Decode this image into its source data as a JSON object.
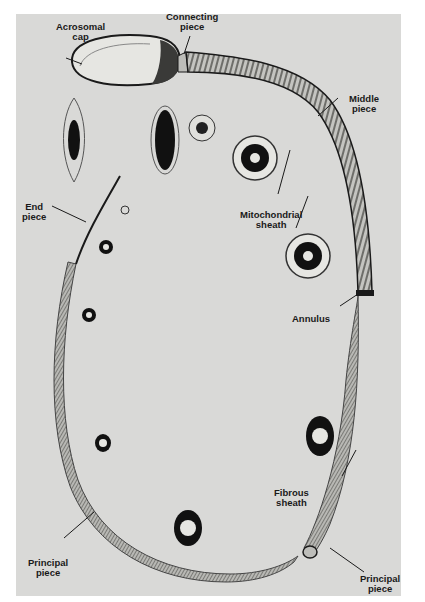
{
  "figure": {
    "background": "#d9d9d7",
    "ink": "#1a1a1a"
  },
  "labels": {
    "acrosomal_cap": "Acrosomal\ncap",
    "connecting_piece": "Connecting\npiece",
    "middle_piece": "Middle\npiece",
    "mitochondrial_sheath": "Mitochondrial\nsheath",
    "end_piece": "End\npiece",
    "annulus": "Annulus",
    "fibrous_sheath": "Fibrous\nsheath",
    "principal_piece_left": "Principal\npiece",
    "principal_piece_right": "Principal\npiece"
  },
  "cross_sections": [
    {
      "region": "head (acrosome, edge view)",
      "shape": "lens"
    },
    {
      "region": "head (flat view)",
      "shape": "ellipse"
    },
    {
      "region": "connecting piece",
      "shape": "small-ring"
    },
    {
      "region": "middle piece",
      "shape": "9+2 axoneme with mitochondria"
    },
    {
      "region": "middle piece (distal)",
      "shape": "9+2 axoneme with mitochondria"
    },
    {
      "region": "principal piece",
      "shape": "fibrous sheath section"
    },
    {
      "region": "principal piece",
      "shape": "fibrous sheath section"
    },
    {
      "region": "principal piece (tail)",
      "shape": "small ring"
    },
    {
      "region": "end piece",
      "shape": "small ring"
    }
  ]
}
